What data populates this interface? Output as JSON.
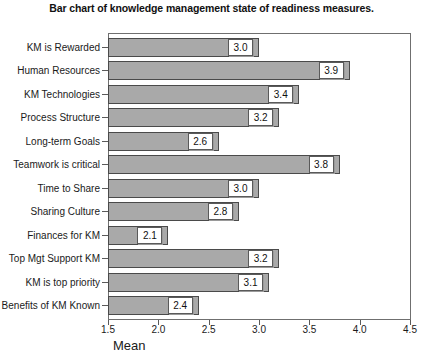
{
  "chart_data": {
    "type": "bar",
    "orientation": "horizontal",
    "title": "Bar chart of knowledge management state of readiness measures.",
    "xlabel": "Mean",
    "ylabel": "",
    "xlim": [
      1.5,
      4.5
    ],
    "xticks": [
      1.5,
      2.0,
      2.5,
      3.0,
      3.5,
      4.0,
      4.5
    ],
    "xticklabels": [
      "1.5",
      "2.0",
      "2.5",
      "3.0",
      "3.5",
      "4.0",
      "4.5"
    ],
    "grid": false,
    "legend": false,
    "bar_color": "#a9a9a9",
    "bar_edge_color": "#4a4a4a",
    "categories": [
      "KM is Rewarded",
      "Human Resources",
      "KM Technologies",
      "Process Structure",
      "Long-term Goals",
      "Teamwork is critical",
      "Time to Share",
      "Sharing Culture",
      "Finances for KM",
      "Top Mgt Support KM",
      "KM is top priority",
      "Benefits of KM Known"
    ],
    "values": [
      3.0,
      3.9,
      3.4,
      3.2,
      2.6,
      3.8,
      3.0,
      2.8,
      2.1,
      3.2,
      3.1,
      2.4
    ],
    "data_labels": [
      "3.0",
      "3.9",
      "3.4",
      "3.2",
      "2.6",
      "3.8",
      "3.0",
      "2.8",
      "2.1",
      "3.2",
      "3.1",
      "2.4"
    ]
  }
}
